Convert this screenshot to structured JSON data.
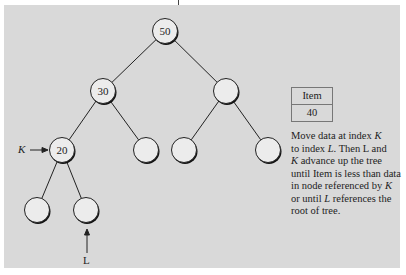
{
  "diagram": {
    "type": "binary-tree-heap-insert",
    "nodes": [
      {
        "id": "root",
        "value": "50",
        "cx": 165,
        "cy": 31
      },
      {
        "id": "n1",
        "value": "30",
        "cx": 103,
        "cy": 91
      },
      {
        "id": "n2",
        "value": "",
        "cx": 226,
        "cy": 91
      },
      {
        "id": "n3",
        "value": "20",
        "cx": 62,
        "cy": 150
      },
      {
        "id": "n4",
        "value": "",
        "cx": 146,
        "cy": 150
      },
      {
        "id": "n5",
        "value": "",
        "cx": 184,
        "cy": 150
      },
      {
        "id": "n6",
        "value": "",
        "cx": 268,
        "cy": 150
      },
      {
        "id": "n7",
        "value": "",
        "cx": 37,
        "cy": 210
      },
      {
        "id": "n8",
        "value": "",
        "cx": 86,
        "cy": 210
      }
    ],
    "edges": [
      [
        "root",
        "n1"
      ],
      [
        "root",
        "n2"
      ],
      [
        "n1",
        "n3"
      ],
      [
        "n1",
        "n4"
      ],
      [
        "n2",
        "n5"
      ],
      [
        "n2",
        "n6"
      ],
      [
        "n3",
        "n7"
      ],
      [
        "n3",
        "n8"
      ]
    ],
    "pointers": {
      "k_label": "K",
      "l_label": "L"
    },
    "item_box": {
      "header": "Item",
      "value": "40"
    },
    "description": {
      "part1": "Move data at index ",
      "k1": "K",
      "part2": " to index ",
      "l1": "L",
      "part3": ". Then L and ",
      "k2": "K",
      "part4": " advance up the tree until Item is less than data in node referenced by ",
      "k3": "K",
      "part5": " or until ",
      "l2": "L",
      "part6": " references the root of tree."
    },
    "colors": {
      "panel": "#d9d9d9",
      "node_fill": "#ececec",
      "stroke": "#222222"
    }
  }
}
